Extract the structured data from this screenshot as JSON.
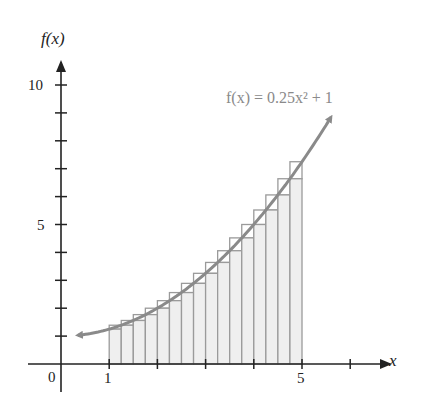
{
  "chart_data": {
    "type": "bar",
    "subtype": "riemann-sum-with-curve",
    "title": "",
    "xlabel": "x",
    "ylabel": "f(x)",
    "function_label": "f(x) = 0.25x² + 1",
    "function": {
      "a": 0.25,
      "b": 0,
      "c": 1
    },
    "xlim": [
      -0.9,
      7.0
    ],
    "ylim": [
      0,
      11
    ],
    "x_ticks": [
      1,
      2,
      3,
      4,
      5,
      6
    ],
    "x_tick_labels": {
      "0": "0",
      "1": "1",
      "5": "5"
    },
    "y_ticks": [
      1,
      2,
      3,
      4,
      5,
      6,
      7,
      8,
      9,
      10
    ],
    "y_tick_labels": {
      "5": "5",
      "10": "10"
    },
    "interval": [
      1,
      5
    ],
    "n_rectangles": 16,
    "width": 0.25,
    "categories": [
      "1.00",
      "1.25",
      "1.50",
      "1.75",
      "2.00",
      "2.25",
      "2.50",
      "2.75",
      "3.00",
      "3.25",
      "3.50",
      "3.75",
      "4.00",
      "4.25",
      "4.50",
      "4.75"
    ],
    "series": [
      {
        "name": "left-endpoint (filled)",
        "values": [
          1.25,
          1.39,
          1.56,
          1.77,
          2.0,
          2.27,
          2.56,
          2.89,
          3.25,
          3.64,
          4.06,
          4.52,
          5.0,
          5.52,
          6.06,
          6.64
        ]
      },
      {
        "name": "right-endpoint (outline)",
        "values": [
          1.39,
          1.56,
          1.77,
          2.0,
          2.27,
          2.56,
          2.89,
          3.25,
          3.64,
          4.06,
          4.52,
          5.0,
          5.52,
          6.06,
          6.64,
          7.25
        ]
      }
    ],
    "curve_x_range": [
      0.35,
      5.6
    ],
    "grid": false,
    "legend": "none"
  },
  "labels": {
    "y_axis": "f(x)",
    "x_axis": "x",
    "origin": "0",
    "x1": "1",
    "x5": "5",
    "y5": "5",
    "y10": "10",
    "function": "f(x) = 0.25x² + 1"
  },
  "colors": {
    "axis": "#222222",
    "curve": "#8a8a8a",
    "bar_fill": "#efefef",
    "bar_stroke": "#9a9a9a"
  }
}
